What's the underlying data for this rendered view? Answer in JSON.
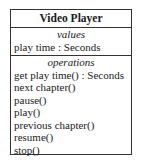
{
  "diagram": {
    "type": "uml-class",
    "class_name": "Video Player",
    "values": {
      "label": "values",
      "items": [
        "play time : Seconds"
      ]
    },
    "operations": {
      "label": "operations",
      "items": [
        "get play time() : Seconds",
        "next chapter()",
        "pause()",
        "play()",
        "previous chapter()",
        "resume()",
        "stop()"
      ]
    },
    "colors": {
      "border": "#333333",
      "text": "#1a1a1a",
      "background": "#ffffff"
    }
  }
}
